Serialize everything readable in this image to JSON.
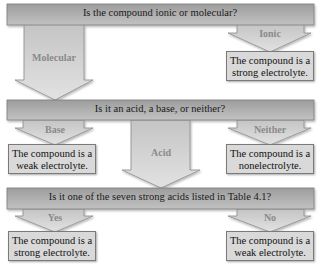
{
  "colors": {
    "band": "#a9a9a9",
    "band_light": "#d2d2d2",
    "arrow": "#d6d6d6",
    "arrow_stroke": "#8c8c8c",
    "result_box": "#d9d9d9",
    "branch_label": "#8a8a8a"
  },
  "diagram": {
    "step1": {
      "question": "Is the compound ionic or molecular?",
      "branches": [
        {
          "label": "Molecular"
        },
        {
          "label": "Ionic",
          "result_line1": "The compound is a",
          "result_line2": "strong electrolyte."
        }
      ]
    },
    "step2": {
      "question": "Is it an acid, a base, or neither?",
      "branches": [
        {
          "label": "Base",
          "result_line1": "The compound is a",
          "result_line2": "weak electrolyte."
        },
        {
          "label": "Acid"
        },
        {
          "label": "Neither",
          "result_line1": "The compound is a",
          "result_line2": "nonelectrolyte."
        }
      ]
    },
    "step3": {
      "question": "Is it one of the seven strong acids listed in Table 4.1?",
      "branches": [
        {
          "label": "Yes",
          "result_line1": "The compound is a",
          "result_line2": "strong electrolyte."
        },
        {
          "label": "No",
          "result_line1": "The compound is a",
          "result_line2": "weak electrolyte."
        }
      ]
    }
  }
}
